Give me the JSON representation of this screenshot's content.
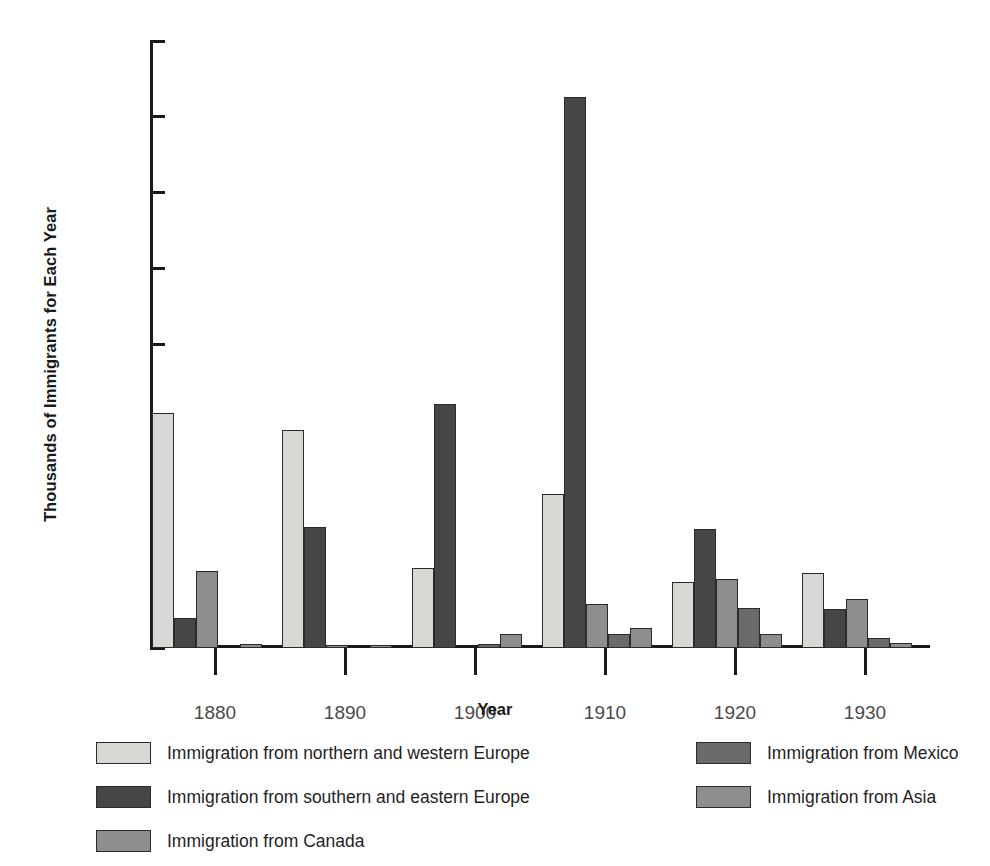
{
  "chart_data": {
    "type": "bar",
    "title": "",
    "xlabel": "Year",
    "ylabel": "Thousands of Immigrants for Each Year",
    "categories": [
      "1880",
      "1890",
      "1900",
      "1910",
      "1920",
      "1930"
    ],
    "ylim": [
      0,
      800
    ],
    "yticks": [
      0,
      100,
      200,
      300,
      400,
      500,
      600,
      700,
      800
    ],
    "ytick_labels": [
      "0",
      "100",
      "200",
      "300",
      "400",
      "500",
      "600",
      "700",
      "800"
    ],
    "grid": false,
    "legend_position": "below-plot",
    "series": [
      {
        "name": "Immigration from northern and western Europe",
        "color": "#d8d8d4",
        "values": [
          310,
          287,
          105,
          203,
          87,
          99
        ]
      },
      {
        "name": "Immigration from southern and eastern Europe",
        "color": "#464646",
        "values": [
          39,
          160,
          322,
          726,
          157,
          51
        ]
      },
      {
        "name": "Immigration from Canada",
        "color": "#8d8d8d",
        "values": [
          101,
          2,
          0,
          58,
          91,
          65
        ]
      },
      {
        "name": "Immigration from Mexico",
        "color": "#6a6a6a",
        "values": [
          0,
          0,
          5,
          18,
          53,
          13
        ]
      },
      {
        "name": "Immigration from Asia",
        "color": "#8d8d8d",
        "values": [
          5,
          4,
          18,
          26,
          19,
          6
        ]
      }
    ]
  },
  "axes": {
    "ylabel": "Thousands of Immigrants for Each Year",
    "xlabel": "Year"
  },
  "legend": {
    "items": [
      {
        "label": "Immigration from northern and western Europe",
        "color": "#d8d8d4"
      },
      {
        "label": "Immigration from southern and eastern Europe",
        "color": "#464646"
      },
      {
        "label": "Immigration from Canada",
        "color": "#8d8d8d"
      },
      {
        "label": "Immigration from Mexico",
        "color": "#6a6a6a"
      },
      {
        "label": "Immigration from Asia",
        "color": "#8d8d8d"
      }
    ]
  }
}
